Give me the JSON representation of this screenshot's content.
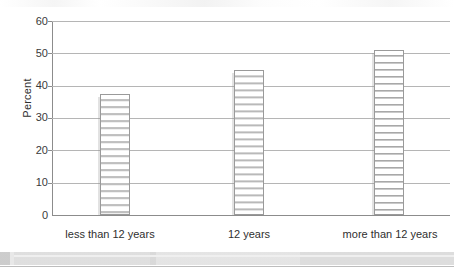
{
  "chart_data": {
    "type": "bar",
    "title": "",
    "subtitle": "",
    "xlabel": "",
    "ylabel": "Percent",
    "categories": [
      "less than 12 years",
      "12 years",
      "more than 12 years"
    ],
    "values": [
      37.5,
      45,
      51
    ],
    "ylim": [
      0,
      60
    ],
    "y_ticks": [
      0,
      10,
      20,
      30,
      40,
      50,
      60
    ],
    "y_tick_labels": [
      "0",
      "10",
      "20",
      "30",
      "40",
      "50",
      "60"
    ],
    "grid": true,
    "grid_axis": "y",
    "legend": false,
    "legend_position": "none",
    "series": [
      {
        "name": "Percent",
        "values": [
          37.5,
          45,
          51
        ],
        "fill": "horizontal-stripes",
        "fill_color": "#ffffff",
        "stripe_color": "#a8a8a8",
        "border_color": "#9a9a9a"
      }
    ],
    "annotations": []
  },
  "axes": {
    "y_title": "Percent",
    "y_ticks": [
      {
        "label": "60",
        "value": 60
      },
      {
        "label": "50",
        "value": 50
      },
      {
        "label": "40",
        "value": 40
      },
      {
        "label": "30",
        "value": 30
      },
      {
        "label": "20",
        "value": 20
      },
      {
        "label": "10",
        "value": 10
      },
      {
        "label": "0",
        "value": 0
      }
    ],
    "x_categories": [
      {
        "label": "less than 12 years"
      },
      {
        "label": "12 years"
      },
      {
        "label": "more than 12 years"
      }
    ]
  },
  "colors": {
    "background": "#ffffff",
    "axis": "#8c8c8c",
    "gridline": "#b5b5b5",
    "bar_border": "#9a9a9a",
    "bar_stripe": "#a8a8a8",
    "text": "#2f2f2f",
    "page_edge": "#dcdcdc"
  }
}
